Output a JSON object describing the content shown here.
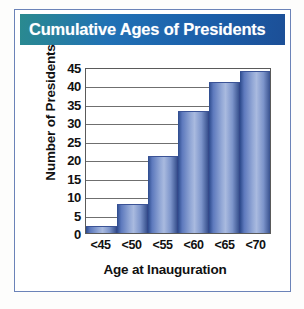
{
  "figure": {
    "banner_title": "Cumulative Ages of Presidents",
    "border_color": "#6b83b8",
    "banner_gradient_from": "#2a8a8f",
    "banner_gradient_to": "#1c4f97",
    "bar_color": "#93a8d6",
    "bar_edge_color": "#2c4a8c",
    "gridline_color": "#6f6f6f",
    "axis_color": "#5a5a5a"
  },
  "chart_data": {
    "type": "bar",
    "title": "Cumulative Ages of Presidents",
    "xlabel": "Age at Inauguration",
    "ylabel": "Number of Presidents",
    "categories": [
      "<45",
      "<50",
      "<55",
      "<60",
      "<65",
      "<70"
    ],
    "values": [
      2,
      8,
      21,
      33,
      41,
      44
    ],
    "ylim": [
      0,
      45
    ],
    "ytick_labels": [
      "45",
      "40",
      "35",
      "30",
      "25",
      "20",
      "15",
      "10",
      "5",
      "0"
    ],
    "ytick_values": [
      45,
      40,
      35,
      30,
      25,
      20,
      15,
      10,
      5,
      0
    ],
    "ytick_step": 5,
    "grid": true,
    "legend": null,
    "cumulative": true
  }
}
